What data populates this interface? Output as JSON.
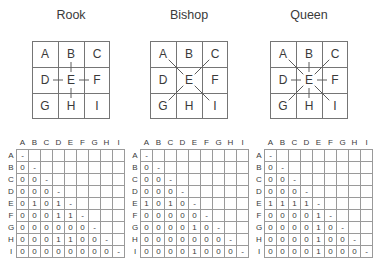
{
  "figure_title": "Chess piece move diagrams with adjacency matrices",
  "board": {
    "letters": [
      "A",
      "B",
      "C",
      "D",
      "E",
      "F",
      "G",
      "H",
      "I"
    ]
  },
  "colors": {
    "background": "#ffffff",
    "text": "#3a3a3a",
    "board_line": "#757575",
    "move_line": "#5c5c5c",
    "matrix_line": "#9a9a9a"
  },
  "pieces": [
    {
      "title": "Rook",
      "edges": [
        "E-B",
        "E-D",
        "E-F",
        "E-H"
      ],
      "matrix": {
        "col_labels": [
          "A",
          "B",
          "C",
          "D",
          "E",
          "F",
          "G",
          "H",
          "I"
        ],
        "row_labels": [
          "A",
          "B",
          "C",
          "D",
          "E",
          "F",
          "G",
          "H",
          "I"
        ],
        "rows": [
          [
            "-"
          ],
          [
            "0",
            "-"
          ],
          [
            "0",
            "0",
            "-"
          ],
          [
            "0",
            "0",
            "0",
            "-"
          ],
          [
            "0",
            "1",
            "0",
            "1",
            "-"
          ],
          [
            "0",
            "0",
            "0",
            "1",
            "1",
            "-"
          ],
          [
            "0",
            "0",
            "0",
            "0",
            "0",
            "0",
            "-"
          ],
          [
            "0",
            "0",
            "0",
            "1",
            "1",
            "0",
            "0",
            "-"
          ],
          [
            "0",
            "0",
            "0",
            "0",
            "0",
            "0",
            "0",
            "0",
            "-"
          ]
        ]
      }
    },
    {
      "title": "Bishop",
      "edges": [
        "E-A",
        "E-C",
        "E-G",
        "E-I"
      ],
      "matrix": {
        "col_labels": [
          "A",
          "B",
          "C",
          "D",
          "E",
          "F",
          "G",
          "H",
          "I"
        ],
        "row_labels": [
          "A",
          "B",
          "C",
          "D",
          "E",
          "F",
          "G",
          "H",
          "I"
        ],
        "rows": [
          [
            "-"
          ],
          [
            "0",
            "-"
          ],
          [
            "0",
            "0",
            "-"
          ],
          [
            "0",
            "0",
            "0",
            "-"
          ],
          [
            "1",
            "0",
            "1",
            "0",
            "-"
          ],
          [
            "0",
            "0",
            "0",
            "0",
            "0",
            "-"
          ],
          [
            "0",
            "0",
            "0",
            "0",
            "1",
            "0",
            "-"
          ],
          [
            "0",
            "0",
            "0",
            "0",
            "0",
            "0",
            "0",
            "-"
          ],
          [
            "0",
            "0",
            "0",
            "0",
            "1",
            "0",
            "0",
            "0",
            "-"
          ]
        ]
      }
    },
    {
      "title": "Queen",
      "edges": [
        "E-A",
        "E-B",
        "E-C",
        "E-D",
        "E-F",
        "E-G",
        "E-H",
        "E-I"
      ],
      "matrix": {
        "col_labels": [
          "A",
          "B",
          "C",
          "D",
          "E",
          "F",
          "G",
          "H",
          "I"
        ],
        "row_labels": [
          "A",
          "B",
          "C",
          "D",
          "E",
          "F",
          "G",
          "H",
          "I"
        ],
        "rows": [
          [
            "-"
          ],
          [
            "0",
            "-"
          ],
          [
            "0",
            "0",
            "-"
          ],
          [
            "0",
            "0",
            "0",
            "-"
          ],
          [
            "1",
            "1",
            "1",
            "1",
            "-"
          ],
          [
            "0",
            "0",
            "0",
            "0",
            "1",
            "-"
          ],
          [
            "0",
            "0",
            "0",
            "0",
            "1",
            "0",
            "-"
          ],
          [
            "0",
            "0",
            "0",
            "0",
            "1",
            "0",
            "0",
            "-"
          ],
          [
            "0",
            "0",
            "0",
            "0",
            "1",
            "0",
            "0",
            "0",
            "-"
          ]
        ]
      }
    }
  ]
}
